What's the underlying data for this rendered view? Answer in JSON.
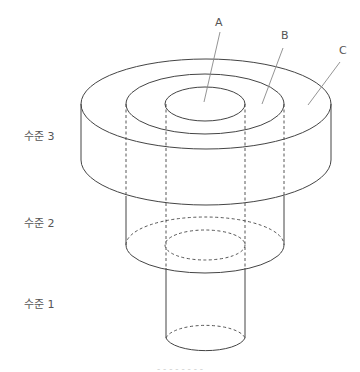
{
  "diagram": {
    "labels": {
      "A": "A",
      "B": "B",
      "C": "C"
    },
    "levels": [
      {
        "label": "수준 3"
      },
      {
        "label": "수준 2"
      },
      {
        "label": "수준 1"
      }
    ],
    "caption": "- - -  - -  - - -",
    "colors": {
      "line": "#444444",
      "leader": "#888888",
      "text": "#555555"
    }
  }
}
